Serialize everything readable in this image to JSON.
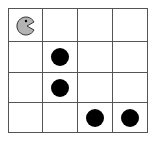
{
  "game": {
    "rows": 4,
    "cols": 4,
    "player": {
      "row": 0,
      "col": 0,
      "icon": "pacman-icon",
      "color": "#b3b3b3"
    },
    "dots": [
      {
        "row": 1,
        "col": 1
      },
      {
        "row": 2,
        "col": 1
      },
      {
        "row": 3,
        "col": 2
      },
      {
        "row": 3,
        "col": 3
      }
    ],
    "dot_color": "#000000"
  }
}
